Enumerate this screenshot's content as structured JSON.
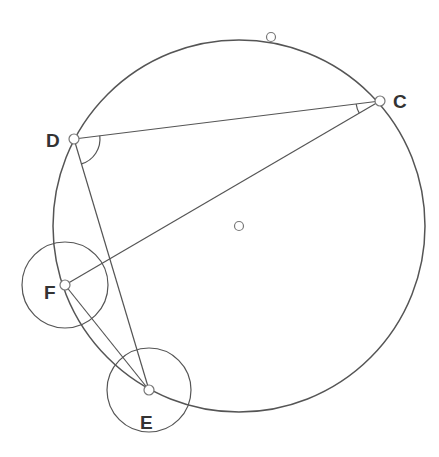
{
  "diagram": {
    "type": "geometry-construction",
    "colors": {
      "stroke": "#555555",
      "label": "#333333",
      "point_fill": "#ffffff",
      "background": "#ffffff"
    },
    "main_circle": {
      "cx": 239,
      "cy": 226,
      "r": 186
    },
    "center_point": {
      "x": 239,
      "y": 226
    },
    "top_point": {
      "x": 271,
      "y": 37
    },
    "points": {
      "C": {
        "label": "C",
        "x": 380,
        "y": 101,
        "lx": 393,
        "ly": 101
      },
      "D": {
        "label": "D",
        "x": 74,
        "y": 139,
        "lx": 46,
        "ly": 140
      },
      "F": {
        "label": "F",
        "x": 65,
        "y": 285,
        "lx": 44,
        "ly": 292
      },
      "E": {
        "label": "E",
        "x": 149,
        "y": 390,
        "lx": 140,
        "ly": 422
      }
    },
    "small_circles": [
      {
        "around": "F",
        "cx": 65,
        "cy": 285,
        "r": 43
      },
      {
        "around": "E",
        "cx": 149,
        "cy": 390,
        "r": 42
      }
    ],
    "segments": [
      [
        "D",
        "C"
      ],
      [
        "C",
        "F"
      ],
      [
        "D",
        "E"
      ],
      [
        "F",
        "E"
      ]
    ],
    "angle_marks": [
      {
        "at": "D",
        "between": [
          "C",
          "E"
        ],
        "r": 26
      },
      {
        "at": "C",
        "between": [
          "D",
          "F"
        ],
        "r": 24
      }
    ]
  }
}
